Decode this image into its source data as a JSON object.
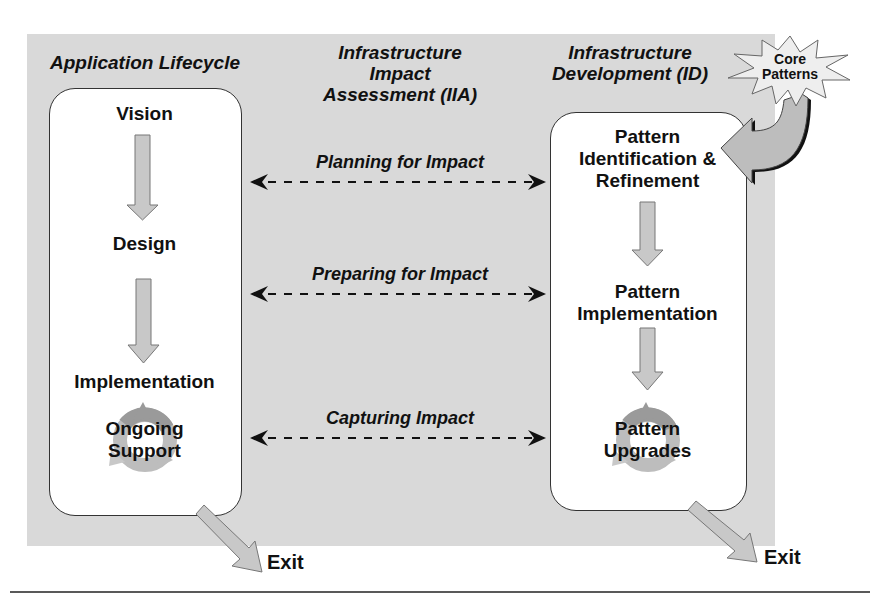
{
  "columns": {
    "left_header": "Application Lifecycle",
    "middle_header": [
      "Infrastructure",
      "Impact",
      "Assessment (IIA)"
    ],
    "right_header": [
      "Infrastructure",
      "Development (ID)"
    ]
  },
  "application_lifecycle": {
    "steps": [
      {
        "label": "Vision"
      },
      {
        "label": "Design"
      },
      {
        "label": "Implementation"
      },
      {
        "label": [
          "Ongoing",
          "Support"
        ],
        "icon": "cycle-icon"
      }
    ],
    "exit_label": "Exit"
  },
  "infrastructure_development": {
    "input": {
      "label": [
        "Core",
        "Patterns"
      ],
      "icon": "starburst-icon"
    },
    "steps": [
      {
        "label": [
          "Pattern",
          "Identification &",
          "Refinement"
        ]
      },
      {
        "label": [
          "Pattern",
          "Implementation"
        ]
      },
      {
        "label": [
          "Pattern",
          "Upgrades"
        ],
        "icon": "cycle-icon"
      }
    ],
    "exit_label": "Exit"
  },
  "impact_links": [
    {
      "label": "Planning for Impact"
    },
    {
      "label": "Preparing for Impact"
    },
    {
      "label": "Capturing Impact"
    }
  ],
  "colors": {
    "panel": "#d9d9d9",
    "box": "#ffffff",
    "arrow_fill": "#c8c8c8",
    "cycle_dark": "#9a9a9a",
    "cycle_light": "#c4c4c4",
    "text": "#111111"
  }
}
